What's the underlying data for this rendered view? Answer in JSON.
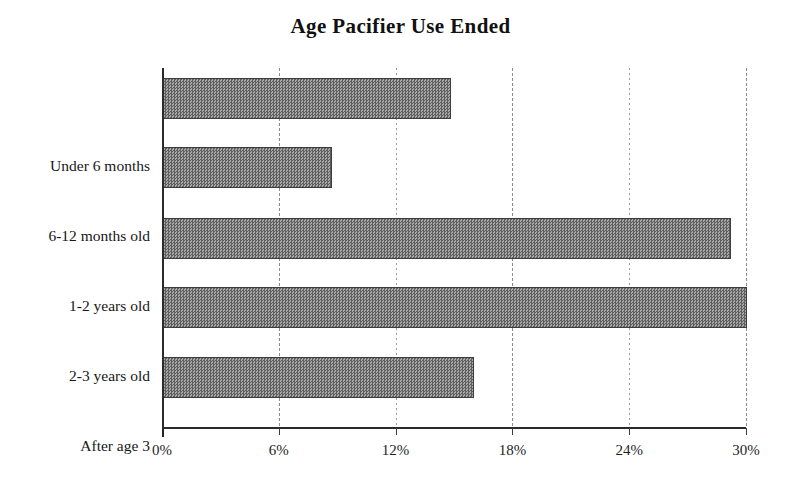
{
  "chart_data": {
    "type": "bar",
    "orientation": "horizontal",
    "title": "Age Pacifier Use Ended",
    "xlabel": "",
    "ylabel": "",
    "categories": [
      "Under 6 months",
      "6-12 months old",
      "1-2 years old",
      "2-3 years old",
      "After age 3"
    ],
    "values": [
      14.8,
      8.7,
      29.2,
      30.0,
      16.0
    ],
    "value_unit": "%",
    "xlim": [
      0,
      30
    ],
    "xticks": [
      0,
      6,
      12,
      18,
      24,
      30
    ],
    "xtick_labels": [
      "0%",
      "6%",
      "12%",
      "18%",
      "24%",
      "30%"
    ],
    "grid": {
      "vertical": true,
      "horizontal": false,
      "style": "dotted"
    },
    "legend": {
      "visible": false,
      "position": "none",
      "entries": []
    },
    "series": [
      {
        "name": "Percent of respondents",
        "values": [
          14.8,
          8.7,
          29.2,
          30.0,
          16.0
        ],
        "fill": "#808080",
        "pattern": "checkered-gray",
        "border_color": "#3d3d3d"
      }
    ],
    "colors": {
      "bar_fill": "#808080",
      "bar_border": "#3d3d3d",
      "axis": "#2b2b2b",
      "gridline": "#9a9a9a",
      "text": "#1a1a1a",
      "background": "#ffffff"
    }
  }
}
